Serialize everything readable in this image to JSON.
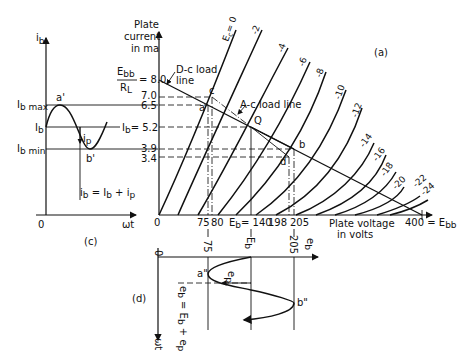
{
  "panel_a": {
    "label": "(a)",
    "y_axis_title": [
      "Plate",
      "current",
      "in ma"
    ],
    "x_axis_title": [
      "Plate voltage",
      "in volts"
    ],
    "y_ticks": [
      {
        "value": 8.0,
        "label": "8.0"
      },
      {
        "value": 7.0,
        "label": "7.0"
      },
      {
        "value": 6.5,
        "label": "6.5"
      },
      {
        "value": 5.2,
        "label": "5.2"
      },
      {
        "value": 3.9,
        "label": "3.9"
      },
      {
        "value": 3.4,
        "label": "3.4"
      }
    ],
    "ebb_rl_num": "E",
    "ebb_rl_num_sub": "bb",
    "ebb_rl_den": "R",
    "ebb_rl_den_sub": "L",
    "ebb_rl_eq": "= 8.0",
    "ib_eq_label": "I",
    "ib_eq_sub": "b",
    "ib_eq_value": "= 5.2",
    "x_ticks": {
      "zero": "0",
      "t75": "75",
      "t80": "80",
      "eb_label": "E",
      "eb_sub": "b",
      "eb_value": "= 140",
      "t198": "198",
      "t205": "205",
      "t400": "400 = E",
      "t400_sub": "bb"
    },
    "grid_curves": [
      "Ec = 0",
      "-2",
      "-4",
      "-6",
      "-8",
      "-10",
      "-12",
      "-14",
      "-16",
      "-18",
      "-20",
      "-22",
      "-24"
    ],
    "ec_label": "E",
    "ec_sub": "c",
    "ec_eq": "= 0",
    "dc_load_line_label": [
      "D-c load",
      "line"
    ],
    "ac_load_line_label": "A-c load line",
    "points": {
      "c": "c",
      "a": "a",
      "q": "Q",
      "b": "b",
      "d": "d"
    }
  },
  "panel_c": {
    "label": "(c)",
    "y_axis_label": "i",
    "y_axis_sub": "b",
    "x_axis_label": "ωt",
    "origin": "0",
    "ib_max": "I",
    "ib_max_sub": "b max",
    "ib": "I",
    "ib_sub": "b",
    "ib_min": "I",
    "ib_min_sub": "b min",
    "point_a": "a'",
    "point_b": "b'",
    "ip_label": "i",
    "ip_sub": "p",
    "equation": "i_b = I_b + i_p"
  },
  "panel_d": {
    "label": "(d)",
    "origin": "0",
    "x_axis_label": "e",
    "x_axis_sub": "b",
    "y_axis_label": "ωt",
    "tick_75": "75",
    "tick_eb": "E",
    "tick_eb_sub": "b",
    "tick_205": "205",
    "point_a": "a\"",
    "point_b": "b\"",
    "ep_label": "e",
    "ep_sub": "p",
    "equation": "e_b = E_b + e_p"
  }
}
